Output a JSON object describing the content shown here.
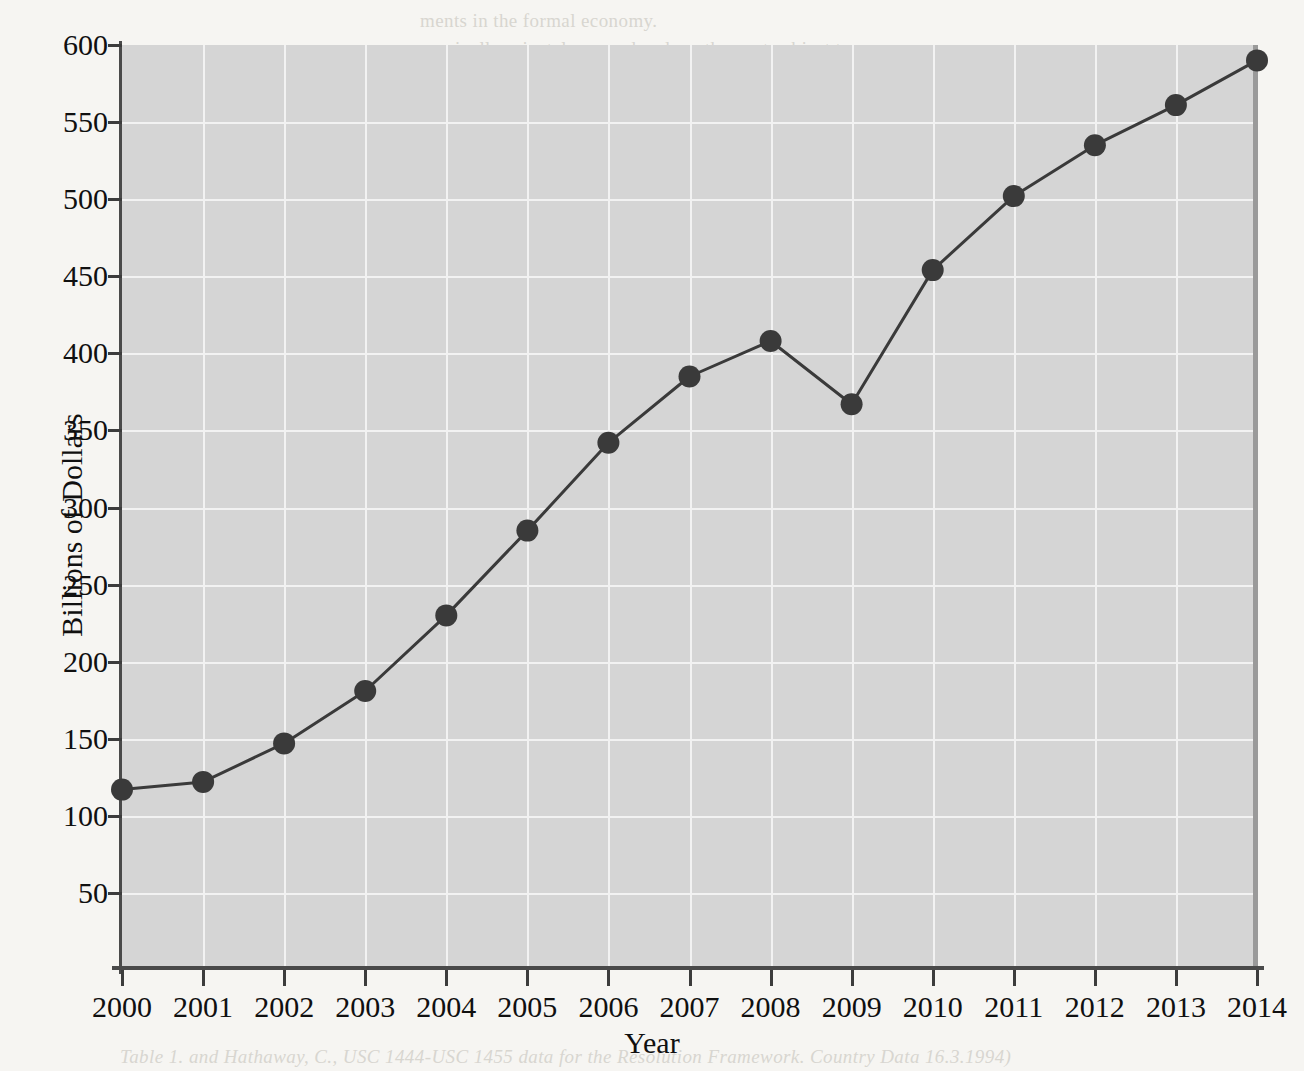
{
  "figure": {
    "background_color": "#f6f5f2",
    "plot_background_color": "#d5d5d5",
    "gridline_color": "#f2f2f2",
    "series_color": "#3a3a3a"
  },
  "chart_data": {
    "type": "line",
    "title": "",
    "xlabel": "Year",
    "ylabel": "Billions of Dollars",
    "categories": [
      "2000",
      "2001",
      "2002",
      "2003",
      "2004",
      "2005",
      "2006",
      "2007",
      "2008",
      "2009",
      "2010",
      "2011",
      "2012",
      "2013",
      "2014"
    ],
    "values": [
      117,
      122,
      147,
      181,
      230,
      285,
      342,
      385,
      408,
      367,
      454,
      502,
      535,
      561,
      590
    ],
    "series": [
      {
        "name": "Billions of Dollars",
        "values": [
          117,
          122,
          147,
          181,
          230,
          285,
          342,
          385,
          408,
          367,
          454,
          502,
          535,
          561,
          590
        ]
      }
    ],
    "x_tick_labels": [
      "2000",
      "2001",
      "2002",
      "2003",
      "2004",
      "2005",
      "2006",
      "2007",
      "2008",
      "2009",
      "2010",
      "2011",
      "2012",
      "2013",
      "2014"
    ],
    "y_tick_labels": [
      "50",
      "100",
      "150",
      "200",
      "250",
      "300",
      "350",
      "400",
      "450",
      "500",
      "550",
      "600"
    ],
    "y_ticks": [
      50,
      100,
      150,
      200,
      250,
      300,
      350,
      400,
      450,
      500,
      550,
      600
    ],
    "ylim": [
      0,
      600
    ],
    "xlim": [
      2000,
      2014
    ],
    "grid": true,
    "grid_axis": "both",
    "legend": false,
    "legend_position": "none",
    "markers": "filled-circle",
    "marker_color": "#3a3a3a",
    "line_width": 3
  },
  "background_text": {
    "lines": [
      {
        "x": 420,
        "y": 10,
        "text": "ments in the formal economy."
      },
      {
        "x": 420,
        "y": 38,
        "text": "nominally privately-owned and are thus not subject to"
      },
      {
        "x": 420,
        "y": 92,
        "text": "cceptance of the economic potential of such"
      },
      {
        "x": 420,
        "y": 120,
        "text": "reformed approach"
      },
      {
        "x": 420,
        "y": 175,
        "text": "st to increase access to economic and financial"
      },
      {
        "x": 420,
        "y": 202,
        "text": "per- and middle-income countries and to the world"
      },
      {
        "x": 330,
        "y": 284,
        "text": "ncreasing flows from immigrants to their families. These are some of these"
      },
      {
        "x": 880,
        "y": 284,
        "text": "flows"
      },
      {
        "x": 930,
        "y": 408,
        "text": "ity 1960-70"
      },
      {
        "x": 420,
        "y": 470,
        "text": "isbursed USD 360 064 or 4 per cent in the form of grants for all beneficiaries and"
      },
      {
        "x": 430,
        "y": 496,
        "text": "n 100 000 from the developing economies for the period under review."
      },
      {
        "x": 760,
        "y": 524,
        "text": "Similarly,"
      },
      {
        "x": 330,
        "y": 566,
        "text": "960-1969 flows in the form of funds to the extent of the total funds remitted"
      },
      {
        "x": 330,
        "y": 596,
        "text": "tions from migrants and the economies of their countries, there were the multi-"
      },
      {
        "x": 330,
        "y": 624,
        "text": "61-90; 30 per cent of the total was in the form of direct financial flows"
      },
      {
        "x": 330,
        "y": 652,
        "text": "f significantly less in the number of recipients and emigrant"
      },
      {
        "x": 330,
        "y": 698,
        "text": "between the concentration of funds from a second period the region 1960-"
      },
      {
        "x": 330,
        "y": 752,
        "text": "as in the region - USD 2 600 in grants. The value of funds remitted was a minimal"
      },
      {
        "x": 330,
        "y": 790,
        "text": "ther economic flows was USD 4 600 but over a number of the funds in the United States"
      },
      {
        "x": 330,
        "y": 818,
        "text": "e USD 1 billion in the world"
      },
      {
        "x": 330,
        "y": 860,
        "text": "share of foreign aid to the United States, the shares of the recipients USD 1 400 in the"
      },
      {
        "x": 330,
        "y": 888,
        "text": "comes from emigrants to immigrants as remittances as a percentage of external aid was"
      },
      {
        "x": 330,
        "y": 916,
        "text": "also was reduced in a number of matters that were financed from the flows."
      }
    ],
    "footnote": "Table 1. and Hathaway, C., USC 1444-USC 1455 data for the Resolution Framework. Country Data 16.3.1994)"
  }
}
